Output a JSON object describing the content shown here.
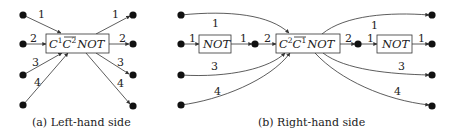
{
  "panel_a": {
    "caption": "(a) Left-hand side",
    "gate": {
      "base1": "C",
      "sup1": "1",
      "base2": "C",
      "sup2": "2",
      "tail": "NOT",
      "overline_on": "C2"
    },
    "input_labels": [
      "1",
      "2",
      "3",
      "4"
    ],
    "output_labels": [
      "1",
      "2",
      "3",
      "4"
    ]
  },
  "panel_b": {
    "caption": "(b) Right-hand side",
    "main_gate": {
      "base1": "C",
      "sup1": "2",
      "base2": "C",
      "sup2": "1",
      "tail": "NOT",
      "overline_on": "C1"
    },
    "not_gate_left": "NOT",
    "not_gate_right": "NOT",
    "input_labels": {
      "top": "1",
      "not_in": "1",
      "not_out": "1",
      "mid_in": "2",
      "third": "3",
      "fourth": "4"
    },
    "output_labels": {
      "top": "1",
      "mid_out": "2",
      "not_in": "1",
      "not_out": "1",
      "third": "3",
      "fourth": "4"
    }
  }
}
